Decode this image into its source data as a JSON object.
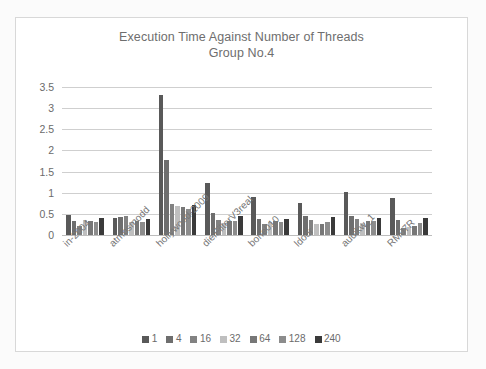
{
  "chart_data": {
    "type": "bar",
    "title": "Execution Time Against Number of Threads",
    "subtitle": "Group No.4",
    "title_lines": [
      "Execution Time Against Number of Threads",
      "Group No.4"
    ],
    "xlabel": "",
    "ylabel": "",
    "ylim": [
      0,
      3.5
    ],
    "yticks": [
      "0",
      "0.5",
      "1",
      "1.5",
      "2",
      "2.5",
      "3",
      "3.5"
    ],
    "ytick_values": [
      0,
      0.5,
      1,
      1.5,
      2,
      2.5,
      3,
      3.5
    ],
    "grid": true,
    "legend_position": "bottom",
    "legend_title": "",
    "categories": [
      "in-2004",
      "atmosmodd",
      "hollywood-2009",
      "dielFilterV3real",
      "bone010",
      "ldoor",
      "audikw_1",
      "RM07R"
    ],
    "series": [
      {
        "name": "1",
        "color": "#595959",
        "values": [
          0.48,
          0.41,
          3.31,
          1.22,
          0.9,
          0.75,
          1.02,
          0.87
        ]
      },
      {
        "name": "4",
        "color": "#6e6e6e",
        "values": [
          0.33,
          0.42,
          1.78,
          0.52,
          0.37,
          0.45,
          0.46,
          0.35
        ]
      },
      {
        "name": "16",
        "color": "#828282",
        "values": [
          0.22,
          0.45,
          0.74,
          0.36,
          0.26,
          0.36,
          0.37,
          0.16
        ]
      },
      {
        "name": "32",
        "color": "#bfbfbf",
        "values": [
          0.36,
          0.3,
          0.68,
          0.28,
          0.31,
          0.25,
          0.29,
          0.18
        ]
      },
      {
        "name": "64",
        "color": "#777777",
        "values": [
          0.34,
          0.34,
          0.67,
          0.34,
          0.33,
          0.27,
          0.33,
          0.22
        ]
      },
      {
        "name": "128",
        "color": "#8c8c8c",
        "values": [
          0.31,
          0.31,
          0.62,
          0.32,
          0.31,
          0.3,
          0.33,
          0.28
        ]
      },
      {
        "name": "240",
        "color": "#3a3a3a",
        "values": [
          0.4,
          0.37,
          0.7,
          0.44,
          0.39,
          0.43,
          0.4,
          0.41
        ]
      }
    ]
  }
}
